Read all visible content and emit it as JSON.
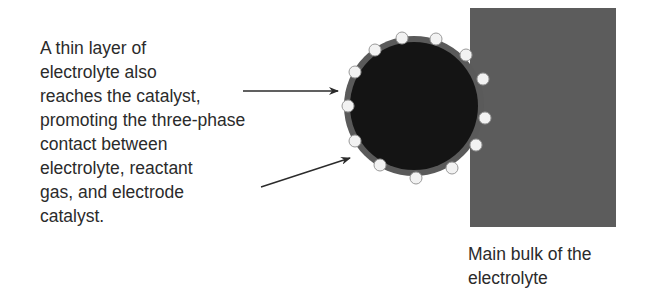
{
  "diagram": {
    "left_annotation": {
      "lines": [
        "A thin layer of",
        "electrolyte also",
        "reaches the catalyst,",
        "promoting the three-phase",
        "contact between",
        "electrolyte, reactant",
        "gas, and electrode",
        "catalyst."
      ]
    },
    "bottom_label": {
      "lines": [
        "Main bulk of the",
        "electrolyte"
      ]
    },
    "colors": {
      "catalyst_particle": "#141414",
      "electrolyte_film": "#5a5a5a",
      "electrolyte_bulk": "#5c5c5c",
      "gas_bubble": "#f2f2f2",
      "arrow": "#2b2b2b",
      "text": "#2b2b2b"
    }
  }
}
